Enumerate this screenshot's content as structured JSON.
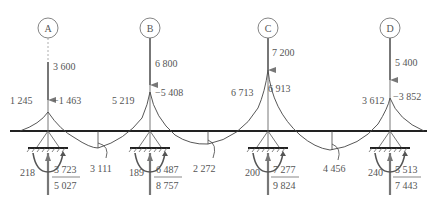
{
  "diagram": {
    "type": "continuous beam moment/reaction diagram",
    "colors": {
      "line": "#333333",
      "text": "#555555",
      "arrow": "#777777",
      "background": "#ffffff"
    },
    "supports": [
      {
        "id": "A",
        "load": "3 600",
        "moment_left": "1 245",
        "moment_right": "−1 463",
        "base_moment": "218",
        "reaction_top": "3 723",
        "reaction_bottom": "5 027"
      },
      {
        "id": "B",
        "load": "6 800",
        "moment_left": "5 219",
        "moment_right": "−5 408",
        "base_moment": "189",
        "reaction_top": "6 487",
        "reaction_bottom": "8 757"
      },
      {
        "id": "C",
        "load": "7 200",
        "moment_left": "6 713",
        "moment_right": "6 913",
        "base_moment": "200",
        "reaction_top": "7 277",
        "reaction_bottom": "9 824"
      },
      {
        "id": "D",
        "load": "5 400",
        "moment_left": "3 612",
        "moment_right": "−3 852",
        "base_moment": "240",
        "reaction_top": "5 513",
        "reaction_bottom": "7 443"
      }
    ],
    "span_moments": [
      {
        "span": "A-B",
        "value": "3 111"
      },
      {
        "span": "B-C",
        "value": "2 272"
      },
      {
        "span": "C-D",
        "value": "4 456"
      }
    ]
  }
}
